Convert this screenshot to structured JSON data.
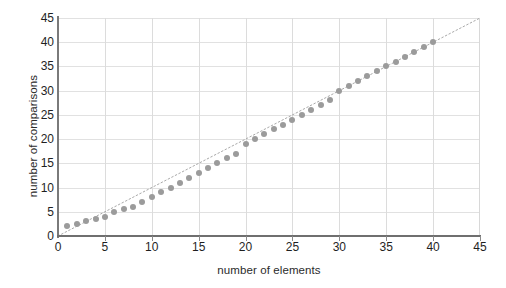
{
  "chart_data": {
    "type": "scatter",
    "title": "",
    "xlabel": "number of elements",
    "ylabel": "number of comparisons",
    "xlim": [
      0,
      45
    ],
    "ylim": [
      0,
      45
    ],
    "xticks": [
      0,
      5,
      10,
      15,
      20,
      25,
      30,
      35,
      40,
      45
    ],
    "yticks": [
      0,
      5,
      10,
      15,
      20,
      25,
      30,
      35,
      40,
      45
    ],
    "grid": true,
    "legend": "none",
    "series": [
      {
        "name": "comparisons",
        "marker": "circle",
        "color": "#9b9b9b",
        "x": [
          1,
          2,
          3,
          4,
          5,
          6,
          7,
          8,
          9,
          10,
          11,
          12,
          13,
          14,
          15,
          16,
          17,
          18,
          19,
          20,
          21,
          22,
          23,
          24,
          25,
          26,
          27,
          28,
          29,
          30,
          31,
          32,
          33,
          34,
          35,
          36,
          37,
          38,
          39,
          40
        ],
        "y": [
          2,
          2.5,
          3,
          3.5,
          4,
          5,
          5.5,
          6,
          7,
          8,
          9,
          10,
          11,
          12,
          13,
          14,
          15,
          16,
          17,
          19,
          20,
          21,
          22,
          23,
          24,
          25,
          26,
          27,
          28,
          30,
          31,
          32,
          33,
          34,
          35,
          36,
          37,
          38,
          39,
          40
        ]
      },
      {
        "name": "reference line y = x",
        "marker": "none",
        "style": "dotted",
        "color": "#a9a9a9",
        "x": [
          0,
          45
        ],
        "y": [
          0,
          45
        ]
      }
    ]
  },
  "axes": {
    "x_title": "number of elements",
    "y_title": "number of comparisons",
    "x_tick_labels": [
      "0",
      "5",
      "10",
      "15",
      "20",
      "25",
      "30",
      "35",
      "40",
      "45"
    ],
    "y_tick_labels": [
      "0",
      "5",
      "10",
      "15",
      "20",
      "25",
      "30",
      "35",
      "40",
      "45"
    ]
  },
  "colors": {
    "marker": "#9b9b9b",
    "refline": "#a9a9a9",
    "grid": "#e1e1e1",
    "axis": "#7a7a7a",
    "text": "#1f1f1f",
    "background": "#ffffff"
  }
}
